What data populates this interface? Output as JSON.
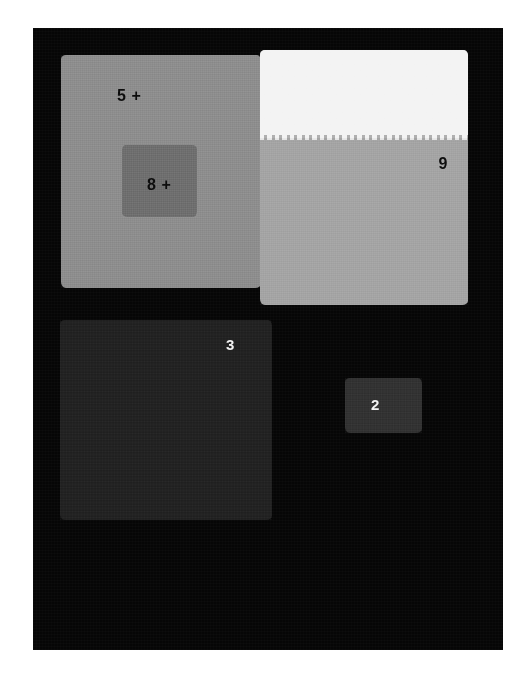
{
  "figure": {
    "background_color": "#ffffff",
    "field_color": "#060606"
  },
  "patches": [
    {
      "id": "patch-5",
      "label": "5 +",
      "label_color": "#0b0b0b",
      "fill_color": "#8c8c8c",
      "position": "top-left",
      "shape": "square"
    },
    {
      "id": "patch-8",
      "label": "8 +",
      "label_color": "#0b0b0b",
      "fill_color": "#6d6d6d",
      "position": "inset-in-patch-5",
      "shape": "square"
    },
    {
      "id": "patch-9",
      "label": "9",
      "label_color": "#0b0b0b",
      "fill_color": "#a3a3a3",
      "upper_fill_color": "#f3f3f3",
      "position": "top-right",
      "shape": "bipartite-square"
    },
    {
      "id": "patch-3",
      "label": "3",
      "label_color": "#f2f2f2",
      "fill_color": "#202020",
      "position": "bottom-left",
      "shape": "square"
    },
    {
      "id": "patch-2",
      "label": "2",
      "label_color": "#f2f2f2",
      "fill_color": "#303030",
      "position": "bottom-right",
      "shape": "rectangle"
    }
  ]
}
